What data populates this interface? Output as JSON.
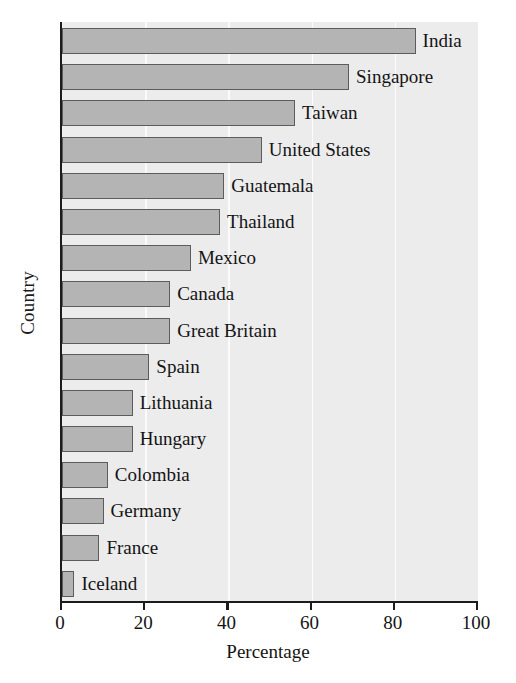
{
  "chart_data": {
    "type": "bar",
    "orientation": "horizontal",
    "title": "",
    "xlabel": "Percentage",
    "ylabel": "Country",
    "xlim": [
      0,
      100
    ],
    "xticks": [
      0,
      20,
      40,
      60,
      80,
      100
    ],
    "xtick_labels": [
      "0",
      "20",
      "40",
      "60",
      "80",
      "100"
    ],
    "gridlines": [
      20,
      40,
      60,
      80
    ],
    "grid": true,
    "legend": "none",
    "categories": [
      "India",
      "Singapore",
      "Taiwan",
      "United States",
      "Guatemala",
      "Thailand",
      "Mexico",
      "Canada",
      "Great Britain",
      "Spain",
      "Lithuania",
      "Hungary",
      "Colombia",
      "Germany",
      "France",
      "Iceland"
    ],
    "values": [
      85,
      69,
      56,
      48,
      39,
      38,
      31,
      26,
      26,
      21,
      17,
      17,
      11,
      10,
      9,
      3
    ],
    "bars": [
      {
        "category": "India",
        "value": 85
      },
      {
        "category": "Singapore",
        "value": 69
      },
      {
        "category": "Taiwan",
        "value": 56
      },
      {
        "category": "United States",
        "value": 48
      },
      {
        "category": "Guatemala",
        "value": 39
      },
      {
        "category": "Thailand",
        "value": 38
      },
      {
        "category": "Mexico",
        "value": 31
      },
      {
        "category": "Canada",
        "value": 26
      },
      {
        "category": "Great Britain",
        "value": 26
      },
      {
        "category": "Spain",
        "value": 21
      },
      {
        "category": "Lithuania",
        "value": 17
      },
      {
        "category": "Hungary",
        "value": 17
      },
      {
        "category": "Colombia",
        "value": 11
      },
      {
        "category": "Germany",
        "value": 10
      },
      {
        "category": "France",
        "value": 9
      },
      {
        "category": "Iceland",
        "value": 3
      }
    ],
    "colors": {
      "bar_fill": "#b4b4b4",
      "bar_edge": "#5c5c5c",
      "plot_background": "#ececec",
      "grid": "#fbfbfb",
      "axis": "#1c1c1c",
      "text": "#141414",
      "figure_background": "#ffffff"
    }
  }
}
